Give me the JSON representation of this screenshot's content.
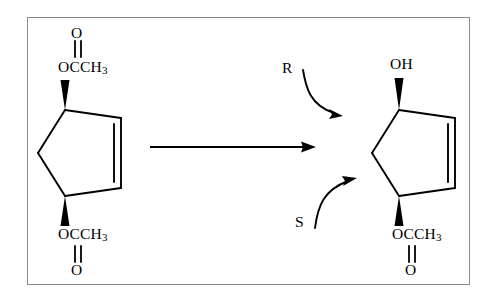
{
  "figure": {
    "type": "chemical-reaction-scheme",
    "background_color": "#ffffff",
    "line_color": "#000000",
    "frame_color": "#8b8b93"
  },
  "reactant": {
    "name": "cis-cyclopent-2-ene-1,4-diyl diacetate",
    "ring": "cyclopentene",
    "top_substituent": {
      "group_label": "OCCH",
      "group_subscript": "3",
      "carbonyl_oxygen_label": "O",
      "bond_style": "solid-wedge"
    },
    "bottom_substituent": {
      "group_label": "OCCH",
      "group_subscript": "3",
      "carbonyl_oxygen_label": "O",
      "bond_style": "solid-wedge"
    }
  },
  "reaction_arrow": {
    "label": "",
    "direction": "right"
  },
  "agents": [
    {
      "label": "R",
      "arrow": "curved-down-right",
      "targets": "top-position"
    },
    {
      "label": "S",
      "arrow": "curved-up-right",
      "targets": "bottom-position"
    }
  ],
  "product": {
    "name": "4-hydroxycyclopent-2-en-1-yl acetate",
    "ring": "cyclopentene",
    "top_substituent": {
      "group_label": "OH",
      "bond_style": "solid-wedge"
    },
    "bottom_substituent": {
      "group_label": "OCCH",
      "group_subscript": "3",
      "carbonyl_oxygen_label": "O",
      "bond_style": "solid-wedge"
    }
  }
}
